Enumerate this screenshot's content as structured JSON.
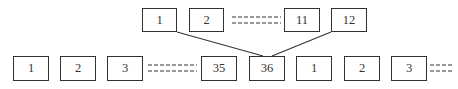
{
  "diagram": {
    "type": "block-mapping",
    "colors": {
      "stroke": "#333333",
      "text": "#333333",
      "background": "#ffffff"
    },
    "top_row": {
      "boxes": [
        {
          "label": "1",
          "x": 142,
          "y": 8,
          "w": 35,
          "h": 24
        },
        {
          "label": "2",
          "x": 189,
          "y": 8,
          "w": 35,
          "h": 24
        },
        {
          "label": "11",
          "x": 284,
          "y": 8,
          "w": 36,
          "h": 24
        },
        {
          "label": "12",
          "x": 331,
          "y": 8,
          "w": 36,
          "h": 24
        }
      ],
      "ellipsis": {
        "x1": 232,
        "x2": 281,
        "y_top": 17,
        "y_bottom": 23
      }
    },
    "bottom_row": {
      "boxes": [
        {
          "label": "1",
          "x": 13,
          "y": 56,
          "w": 36,
          "h": 25
        },
        {
          "label": "2",
          "x": 60,
          "y": 56,
          "w": 36,
          "h": 25
        },
        {
          "label": "3",
          "x": 107,
          "y": 56,
          "w": 36,
          "h": 25
        },
        {
          "label": "35",
          "x": 201,
          "y": 56,
          "w": 36,
          "h": 25
        },
        {
          "label": "36",
          "x": 249,
          "y": 56,
          "w": 36,
          "h": 25
        },
        {
          "label": "1",
          "x": 296,
          "y": 56,
          "w": 36,
          "h": 25
        },
        {
          "label": "2",
          "x": 344,
          "y": 56,
          "w": 36,
          "h": 25
        },
        {
          "label": "3",
          "x": 391,
          "y": 56,
          "w": 36,
          "h": 25
        }
      ],
      "ellipses": [
        {
          "x1": 148,
          "x2": 197,
          "y_top": 65,
          "y_bottom": 71
        },
        {
          "x1": 430,
          "x2": 452,
          "y_top": 65,
          "y_bottom": 71
        }
      ]
    },
    "links": [
      {
        "from": "top_row.1",
        "to": "bottom_row.36",
        "x1": 177,
        "y1": 32,
        "x2": 263,
        "y2": 56
      },
      {
        "from": "top_row.12",
        "to": "bottom_row.36",
        "x1": 331,
        "y1": 32,
        "x2": 272,
        "y2": 56
      }
    ]
  }
}
